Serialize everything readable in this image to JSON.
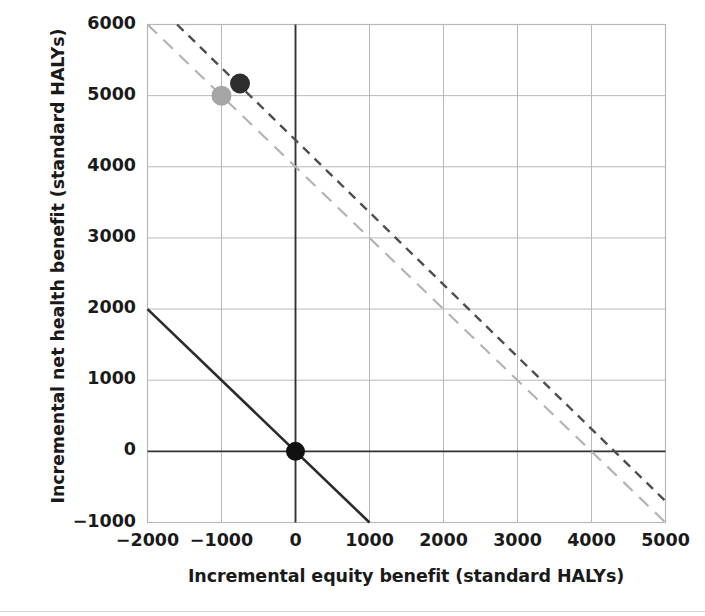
{
  "chart_data": {
    "type": "line",
    "title": "",
    "xlabel": "Incremental equity benefit (standard HALYs)",
    "ylabel": "Incremental net health benefit (standard HALYs)",
    "xlim": [
      -2000,
      5000
    ],
    "ylim": [
      -1000,
      6000
    ],
    "xticks": [
      -2000,
      -1000,
      0,
      1000,
      2000,
      3000,
      4000,
      5000
    ],
    "yticks": [
      -1000,
      0,
      1000,
      2000,
      3000,
      4000,
      5000,
      6000
    ],
    "xtick_labels": [
      "−2000",
      "−1000",
      "0",
      "1000",
      "2000",
      "3000",
      "4000",
      "5000"
    ],
    "ytick_labels": [
      "−1000",
      "0",
      "1000",
      "2000",
      "3000",
      "4000",
      "5000",
      "6000"
    ],
    "grid": true,
    "grid_color": "#b8b8b8",
    "axis_color": "#3a3a3a",
    "zero_axis_color": "#333333",
    "legend": "none",
    "series": [
      {
        "name": "reference line (current equity weight)",
        "type": "line",
        "style": "solid",
        "color": "#2b2b2b",
        "linewidth": 2.6,
        "x": [
          -2000,
          1000
        ],
        "y": [
          2000,
          -1000
        ],
        "slope": -1,
        "intercept": 0
      },
      {
        "name": "scenario line (grey long dash)",
        "type": "line",
        "style": "long-dash",
        "color": "#b3b3b3",
        "linewidth": 2.2,
        "x": [
          -2000,
          5000
        ],
        "y": [
          6000,
          -1000
        ],
        "slope": -1,
        "intercept": 4000
      },
      {
        "name": "scenario line (dark short dash)",
        "type": "line",
        "style": "short-dash",
        "color": "#4d4d4d",
        "linewidth": 2.4,
        "x": [
          -1600,
          5000
        ],
        "y": [
          6000,
          -700
        ],
        "slope": -1.015,
        "intercept": 4375
      }
    ],
    "points": [
      {
        "name": "origin-point",
        "x": 0,
        "y": 0,
        "color": "#111111",
        "radius": 9.5,
        "label": ""
      },
      {
        "name": "grey-scenario-point",
        "x": -1000,
        "y": 5000,
        "color": "#a6a6a6",
        "radius": 10,
        "label": ""
      },
      {
        "name": "dark-scenario-point",
        "x": -750,
        "y": 5170,
        "color": "#2e2e2e",
        "radius": 10,
        "label": ""
      }
    ]
  },
  "axis_titles": {
    "x": "Incremental equity benefit (standard HALYs)",
    "y": "Incremental net health benefit (standard HALYs)"
  }
}
